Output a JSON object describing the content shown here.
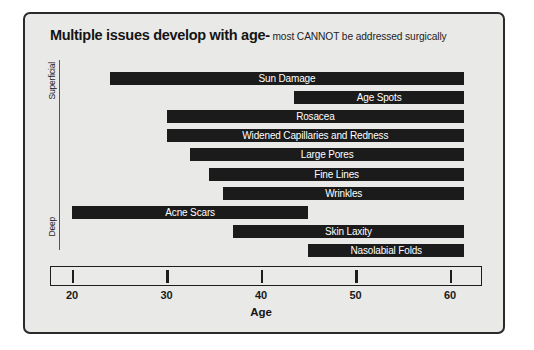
{
  "chart": {
    "title_main": "Multiple issues develop with age-",
    "title_sub": " most CANNOT be addressed surgically"
  },
  "depth_axis": {
    "top_label": "Superficial",
    "bottom_label": "Deep"
  },
  "chart_data": {
    "type": "bar",
    "orientation": "horizontal",
    "title": "Multiple issues develop with age- most CANNOT be addressed surgically",
    "subtitle": "most CANNOT be addressed surgically",
    "xlabel": "Age",
    "ylabel": "",
    "xlim": [
      18,
      63
    ],
    "xticks": [
      20,
      30,
      40,
      50,
      60
    ],
    "xtick_labels": [
      "20",
      "30",
      "40",
      "50",
      "60"
    ],
    "grid": false,
    "legend": null,
    "y_axis_annotation": [
      "Superficial",
      "Deep"
    ],
    "note": "Each bar is an age range (start age to end age) over which the skin issue develops.",
    "categories": [
      "Sun Damage",
      "Age Spots",
      "Rosacea",
      "Widened Capillaries and Redness",
      "Large Pores",
      "Fine Lines",
      "Wrinkles",
      "Acne Scars",
      "Skin Laxity",
      "Nasolabial Folds"
    ],
    "ranges": [
      [
        24.0,
        61.5
      ],
      [
        43.5,
        61.5
      ],
      [
        30.0,
        61.5
      ],
      [
        30.0,
        61.5
      ],
      [
        32.5,
        61.5
      ],
      [
        34.5,
        61.5
      ],
      [
        36.0,
        61.5
      ],
      [
        20.0,
        45.0
      ],
      [
        37.0,
        61.5
      ],
      [
        45.0,
        61.5
      ]
    ],
    "bars": [
      {
        "label": "Sun Damage",
        "start": 24.0,
        "end": 61.5,
        "row": 0
      },
      {
        "label": "Age Spots",
        "start": 43.5,
        "end": 61.5,
        "row": 1
      },
      {
        "label": "Rosacea",
        "start": 30.0,
        "end": 61.5,
        "row": 2
      },
      {
        "label": "Widened Capillaries and Redness",
        "start": 30.0,
        "end": 61.5,
        "row": 3
      },
      {
        "label": "Large Pores",
        "start": 32.5,
        "end": 61.5,
        "row": 4
      },
      {
        "label": "Fine Lines",
        "start": 34.5,
        "end": 61.5,
        "row": 5
      },
      {
        "label": "Wrinkles",
        "start": 36.0,
        "end": 61.5,
        "row": 6
      },
      {
        "label": "Acne Scars",
        "start": 20.0,
        "end": 45.0,
        "row": 7
      },
      {
        "label": "Skin Laxity",
        "start": 37.0,
        "end": 61.5,
        "row": 8
      },
      {
        "label": "Nasolabial Folds",
        "start": 45.0,
        "end": 61.5,
        "row": 9
      }
    ],
    "colors": {
      "bar": "#1b1b1b",
      "bar_label": "#ffffff",
      "panel_background": "#e9e9e7",
      "panel_border": "#2a2a2a",
      "axis": "#1d1d1d"
    }
  }
}
